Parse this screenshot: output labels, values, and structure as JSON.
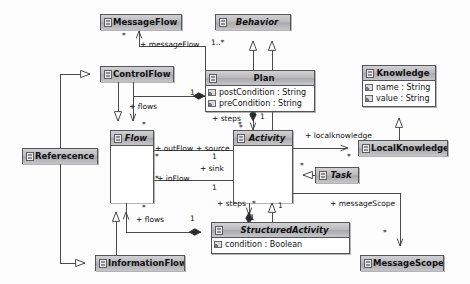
{
  "diagram": {
    "type": "uml-class-diagram",
    "background_color": "#fdfdfd",
    "line_color": "#4a4a4d",
    "header_fill": "#b9b9bc"
  },
  "classes": [
    {
      "id": "messageflow",
      "name": "MessageFlow",
      "abstract": false,
      "attributes": [],
      "x": 100,
      "y": 14,
      "w": 82,
      "h": 16
    },
    {
      "id": "behavior",
      "name": "Behavior",
      "abstract": true,
      "attributes": [],
      "x": 215,
      "y": 14,
      "w": 76,
      "h": 16
    },
    {
      "id": "controlflow",
      "name": "ControlFlow",
      "abstract": false,
      "attributes": [],
      "x": 100,
      "y": 66,
      "w": 74,
      "h": 16
    },
    {
      "id": "plan",
      "name": "Plan",
      "abstract": false,
      "attributes": [
        "postCondition : String",
        "preCondition : String"
      ],
      "x": 205,
      "y": 70,
      "w": 110,
      "h": 42
    },
    {
      "id": "knowledge",
      "name": "Knowledge",
      "abstract": false,
      "attributes": [
        "name : String",
        "value : String"
      ],
      "x": 362,
      "y": 65,
      "w": 74,
      "h": 42
    },
    {
      "id": "flow",
      "name": "Flow",
      "abstract": true,
      "attributes": [],
      "x": 110,
      "y": 130,
      "w": 44,
      "h": 73
    },
    {
      "id": "activity",
      "name": "Activity",
      "abstract": true,
      "attributes": [],
      "x": 233,
      "y": 130,
      "w": 60,
      "h": 73
    },
    {
      "id": "localknowledge",
      "name": "LocalKnowledge",
      "abstract": false,
      "attributes": [],
      "x": 358,
      "y": 140,
      "w": 90,
      "h": 16
    },
    {
      "id": "task",
      "name": "Task",
      "abstract": true,
      "attributes": [],
      "x": 315,
      "y": 167,
      "w": 44,
      "h": 16
    },
    {
      "id": "referecence",
      "name": "Referecence",
      "abstract": false,
      "attributes": [],
      "x": 22,
      "y": 148,
      "w": 76,
      "h": 16
    },
    {
      "id": "structuredactivity",
      "name": "StructuredActivity",
      "abstract": true,
      "attributes": [
        "condition : Boolean"
      ],
      "x": 211,
      "y": 222,
      "w": 139,
      "h": 32
    },
    {
      "id": "informationflow",
      "name": "InformationFlow",
      "abstract": false,
      "attributes": [],
      "x": 95,
      "y": 255,
      "w": 90,
      "h": 16
    },
    {
      "id": "messagescope",
      "name": "MessageScope",
      "abstract": false,
      "attributes": [],
      "x": 360,
      "y": 255,
      "w": 84,
      "h": 16
    }
  ],
  "edge_labels": [
    {
      "id": "lbl-messageflow",
      "text": "+ messageFlow",
      "x": 140,
      "y": 40
    },
    {
      "id": "lbl-flows-top",
      "text": "+ flows",
      "x": 129,
      "y": 102
    },
    {
      "id": "lbl-outflow",
      "text": "+ outFlow",
      "x": 155,
      "y": 144
    },
    {
      "id": "lbl-source",
      "text": "+ source",
      "x": 196,
      "y": 144
    },
    {
      "id": "lbl-sink",
      "text": "+ sink",
      "x": 200,
      "y": 164
    },
    {
      "id": "lbl-inflow",
      "text": "+ inFlow",
      "x": 157,
      "y": 174
    },
    {
      "id": "lbl-steps-top",
      "text": "+ steps",
      "x": 212,
      "y": 114
    },
    {
      "id": "lbl-localknowledge",
      "text": "+ localknowledge",
      "x": 305,
      "y": 131
    },
    {
      "id": "lbl-steps-bottom",
      "text": "+ steps",
      "x": 217,
      "y": 199
    },
    {
      "id": "lbl-messagescope",
      "text": "+ messageScope",
      "x": 330,
      "y": 199
    },
    {
      "id": "lbl-flows-bottom",
      "text": "+ flows",
      "x": 136,
      "y": 215
    }
  ],
  "multiplicities": [
    {
      "id": "mult-messageflow-star",
      "text": "*",
      "x": 122,
      "y": 31
    },
    {
      "id": "mult-behavior-1star",
      "text": "1..*",
      "x": 211,
      "y": 38
    },
    {
      "id": "mult-plan-flows-1",
      "text": "1",
      "x": 190,
      "y": 88
    },
    {
      "id": "mult-flow-star-top",
      "text": "*",
      "x": 142,
      "y": 120
    },
    {
      "id": "mult-activity-star-top",
      "text": "*",
      "x": 238,
      "y": 120
    },
    {
      "id": "mult-steps-1",
      "text": "1",
      "x": 260,
      "y": 112
    },
    {
      "id": "mult-steps-star",
      "text": "*",
      "x": 239,
      "y": 123
    },
    {
      "id": "mult-source-1",
      "text": "1",
      "x": 212,
      "y": 152
    },
    {
      "id": "mult-outflow-star",
      "text": "*",
      "x": 155,
      "y": 152
    },
    {
      "id": "mult-inflow-star",
      "text": "*",
      "x": 155,
      "y": 174
    },
    {
      "id": "mult-sink-1",
      "text": "1",
      "x": 212,
      "y": 183
    },
    {
      "id": "mult-localknowledge-star",
      "text": "*",
      "x": 347,
      "y": 152
    },
    {
      "id": "mult-task-star",
      "text": "*",
      "x": 300,
      "y": 161
    },
    {
      "id": "mult-flow-star-bottom",
      "text": "*",
      "x": 142,
      "y": 203
    },
    {
      "id": "mult-struct-star",
      "text": "*",
      "x": 252,
      "y": 199
    },
    {
      "id": "mult-struct-1",
      "text": "1",
      "x": 278,
      "y": 201
    },
    {
      "id": "mult-struct-steps-1",
      "text": "1",
      "x": 250,
      "y": 213
    },
    {
      "id": "mult-flows-bottom-1",
      "text": "1",
      "x": 190,
      "y": 214
    },
    {
      "id": "mult-messagescope-star",
      "text": "*",
      "x": 383,
      "y": 228
    }
  ]
}
